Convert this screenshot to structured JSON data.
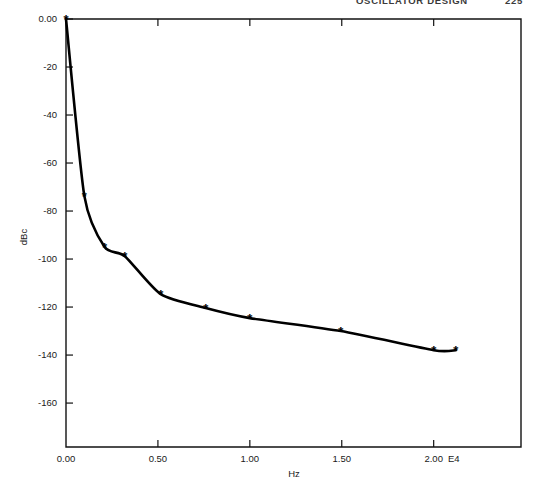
{
  "page_header": {
    "title": "OSCILLATOR DESIGN",
    "page_number": "225"
  },
  "chart_data": {
    "type": "line",
    "title": "",
    "subtitle": "",
    "xlabel": "Hz",
    "ylabel": "dBc",
    "x_exponent_label": "E4",
    "x_tick_labels": [
      "0.00",
      "0.50",
      "1.00",
      "1.50",
      "2.00"
    ],
    "x_ticks": [
      0.0,
      0.5,
      1.0,
      1.5,
      2.0
    ],
    "y_tick_labels": [
      "0.00",
      "-20",
      "-40",
      "-60",
      "-80",
      "-100",
      "-120",
      "-140",
      "-160"
    ],
    "y_ticks": [
      0,
      -20,
      -40,
      -60,
      -80,
      -100,
      -120,
      -140,
      -160
    ],
    "xlim": [
      0.0,
      2.475
    ],
    "ylim": [
      -178.3,
      0.0
    ],
    "grid": false,
    "legend": "none",
    "marker_symbol": "*",
    "series": [
      {
        "name": "phase noise",
        "x": [
          0.0,
          0.1,
          0.21,
          0.32,
          0.515,
          0.76,
          1.0,
          1.495,
          2.0,
          2.12
        ],
        "values": [
          0.0,
          -73.8,
          -95.0,
          -98.8,
          -114.6,
          -120.4,
          -124.6,
          -130.0,
          -138.0,
          -138.0
        ]
      }
    ]
  }
}
